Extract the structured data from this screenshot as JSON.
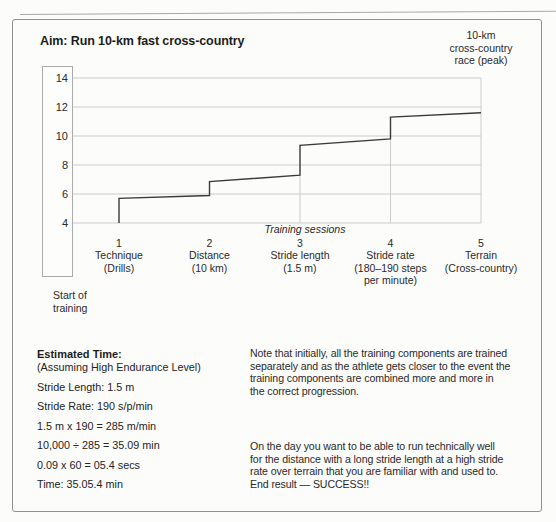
{
  "colors": {
    "grid": "#cccccc",
    "step_line": "#3a3a3a",
    "border": "#8f8f8f",
    "axis_box_border": "#ababab",
    "text": "#242424"
  },
  "chart_data": {
    "type": "line",
    "subtype": "step-progression",
    "title": "Aim: Run 10-km fast cross-country",
    "xlabel": "Training sessions",
    "ylabel": "",
    "ylim": [
      4,
      14
    ],
    "y_ticks": [
      14,
      12,
      10,
      8,
      6,
      4
    ],
    "grid": true,
    "peak_label_lines": [
      "10-km",
      "cross-country",
      "race (peak)"
    ],
    "start_label_lines": [
      "Start of",
      "training"
    ],
    "sessions": [
      {
        "number": "1",
        "lines": [
          "Technique",
          "(Drills)"
        ]
      },
      {
        "number": "2",
        "lines": [
          "Distance",
          "(10 km)"
        ]
      },
      {
        "number": "3",
        "lines": [
          "Stride length",
          "(1.5 m)"
        ]
      },
      {
        "number": "4",
        "lines": [
          "Stride rate",
          "(180–190 steps",
          "per minute)"
        ]
      },
      {
        "number": "5",
        "lines": [
          "Terrain",
          "(Cross-country)"
        ]
      }
    ],
    "step_points": [
      [
        1,
        4.0
      ],
      [
        1,
        5.7
      ],
      [
        2,
        5.9
      ],
      [
        2,
        6.85
      ],
      [
        3,
        7.3
      ],
      [
        3,
        9.35
      ],
      [
        4,
        9.8
      ],
      [
        4,
        11.3
      ],
      [
        5,
        11.6
      ]
    ],
    "vertical_gridlines": [
      {
        "session": 3,
        "extent": "from_line"
      },
      {
        "session": 4,
        "extent": "from_line"
      },
      {
        "session": 5,
        "extent": "full"
      }
    ]
  },
  "estimated_time": {
    "heading": "Estimated Time:",
    "subheading": "(Assuming High Endurance Level)",
    "lines": [
      "Stride Length: 1.5 m",
      "Stride Rate: 190 s/p/min",
      "1.5 m x 190 = 285 m/min",
      "10,000 ÷ 285 = 35.09 min",
      "0.09 x 60 = 05.4 secs",
      "Time: 35.05.4 min"
    ]
  },
  "notes": {
    "paragraph1_lines": [
      "Note that initially, all the training components are trained",
      "separately and as the athlete gets closer to the event the",
      "training components are combined more and more in",
      "the correct progression."
    ],
    "paragraph2_lines": [
      "On the day you want to be able to run technically well",
      "for the distance with a long stride length at a high stride",
      "rate over terrain that you are familiar with and used to.",
      "End result — SUCCESS!!"
    ]
  }
}
